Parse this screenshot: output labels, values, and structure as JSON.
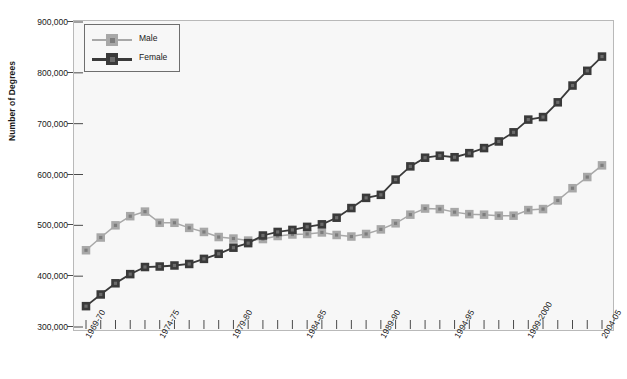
{
  "chart_data": {
    "type": "line",
    "title": "",
    "xlabel": "",
    "ylabel": "Number of Degrees",
    "ylim": [
      300000,
      900000
    ],
    "ytick_values": [
      300000,
      400000,
      500000,
      600000,
      700000,
      800000,
      900000
    ],
    "ytick_labels": [
      "300,000",
      "400,000",
      "500,000",
      "600,000",
      "700,000",
      "800,000",
      "900,000"
    ],
    "grid": false,
    "legend_position": "top-left",
    "categories": [
      "1969-70",
      "1970-71",
      "1971-72",
      "1972-73",
      "1973-74",
      "1974-75",
      "1975-76",
      "1976-77",
      "1977-78",
      "1978-79",
      "1979-80",
      "1980-81",
      "1981-82",
      "1982-83",
      "1983-84",
      "1984-85",
      "1985-86",
      "1986-87",
      "1987-88",
      "1988-89",
      "1989-90",
      "1990-91",
      "1991-92",
      "1992-93",
      "1993-94",
      "1994-95",
      "1995-96",
      "1996-97",
      "1997-98",
      "1998-99",
      "1999-2000",
      "2000-01",
      "2001-02",
      "2002-03",
      "2003-04",
      "2004-05"
    ],
    "xtick_labels_shown": [
      "1969-70",
      "1974-75",
      "1979-80",
      "1984-85",
      "1989-90",
      "1994-95",
      "1999-2000",
      "2004-05"
    ],
    "xtick_label_indices": [
      0,
      5,
      10,
      15,
      20,
      25,
      30,
      35
    ],
    "series": [
      {
        "name": "Male",
        "color": "#a8a8a8",
        "marker": "square",
        "values": [
          451000,
          476000,
          500000,
          518000,
          527000,
          505000,
          505000,
          495000,
          487000,
          477000,
          474000,
          470000,
          473000,
          479000,
          482000,
          483000,
          486000,
          481000,
          478000,
          483000,
          492000,
          504000,
          521000,
          533000,
          532000,
          526000,
          522000,
          521000,
          519000,
          519000,
          530000,
          532000,
          549000,
          573000,
          595000,
          618000
        ]
      },
      {
        "name": "Female",
        "color": "#3a3a3a",
        "marker": "square",
        "values": [
          341000,
          364000,
          386000,
          404000,
          418000,
          419000,
          421000,
          424000,
          434000,
          444000,
          456000,
          465000,
          480000,
          487000,
          491000,
          497000,
          502000,
          515000,
          534000,
          554000,
          560000,
          590000,
          616000,
          633000,
          637000,
          634000,
          642000,
          652000,
          665000,
          683000,
          708000,
          713000,
          742000,
          775000,
          804000,
          832000
        ]
      }
    ]
  },
  "legend": {
    "items": [
      {
        "label": "Male",
        "color": "#a8a8a8"
      },
      {
        "label": "Female",
        "color": "#3a3a3a"
      }
    ]
  },
  "axis": {
    "y_title": "Number of Degrees"
  }
}
